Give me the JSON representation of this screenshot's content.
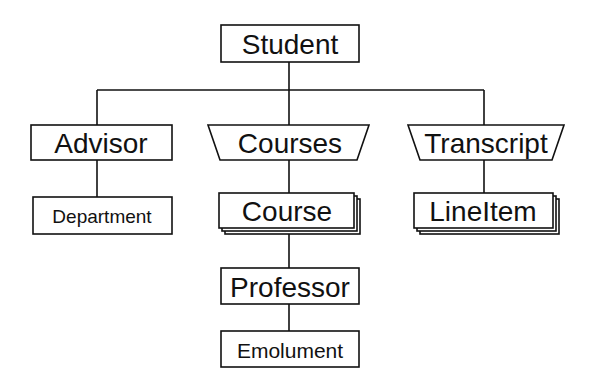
{
  "diagram": {
    "type": "hierarchy",
    "background": "#ffffff",
    "line_color": "#111111",
    "nodes": {
      "student": {
        "label": "Student",
        "shape": "rectangle",
        "font_size": 28
      },
      "advisor": {
        "label": "Advisor",
        "shape": "rectangle",
        "font_size": 28
      },
      "courses": {
        "label": "Courses",
        "shape": "trapezoid",
        "font_size": 28
      },
      "transcript": {
        "label": "Transcript",
        "shape": "trapezoid",
        "font_size": 28
      },
      "department": {
        "label": "Department",
        "shape": "rectangle",
        "font_size": 19
      },
      "course": {
        "label": "Course",
        "shape": "stacked-rectangle",
        "font_size": 28
      },
      "lineitem": {
        "label": "LineItem",
        "shape": "stacked-rectangle",
        "font_size": 28
      },
      "professor": {
        "label": "Professor",
        "shape": "rectangle",
        "font_size": 28
      },
      "emolument": {
        "label": "Emolument",
        "shape": "rectangle",
        "font_size": 21
      }
    },
    "edges": [
      {
        "from": "Student",
        "to": "Advisor"
      },
      {
        "from": "Student",
        "to": "Courses"
      },
      {
        "from": "Student",
        "to": "Transcript"
      },
      {
        "from": "Advisor",
        "to": "Department"
      },
      {
        "from": "Courses",
        "to": "Course"
      },
      {
        "from": "Transcript",
        "to": "LineItem"
      },
      {
        "from": "Course",
        "to": "Professor"
      },
      {
        "from": "Professor",
        "to": "Emolument"
      }
    ]
  }
}
